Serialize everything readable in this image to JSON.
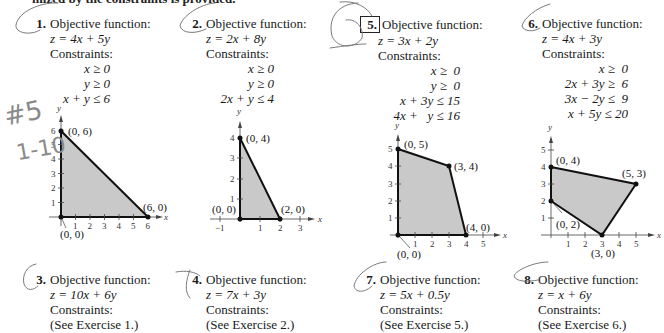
{
  "page": {
    "top_line": "mized by the constraints is provided."
  },
  "exercises": [
    {
      "number": "1.",
      "boxed": false,
      "heading": "Objective function:",
      "objective": "z = 4x + 5y",
      "constraints_label": "Constraints:",
      "constraints": [
        "x ≥ 0",
        "y ≥ 0",
        "x + y ≤ 6"
      ]
    },
    {
      "number": "2.",
      "boxed": false,
      "heading": "Objective function:",
      "objective": "z = 2x + 8y",
      "constraints_label": "Constraints:",
      "constraints": [
        "x ≥ 0",
        "y ≥ 0",
        "2x + y ≤ 4"
      ]
    },
    {
      "number": "3.",
      "boxed": false,
      "heading": "Objective function:",
      "objective": "z = 10x + 6y",
      "constraints_label": "Constraints:",
      "see": "(See Exercise 1.)"
    },
    {
      "number": "4.",
      "boxed": false,
      "heading": "Objective function:",
      "objective": "z = 7x + 3y",
      "constraints_label": "Constraints:",
      "see": "(See Exercise 2.)"
    },
    {
      "number": "5.",
      "boxed": true,
      "heading": "Objective function:",
      "objective": "z = 3x + 2y",
      "constraints_label": "Constraints:",
      "constraints": [
        "x ≥  0",
        "y ≥  0",
        "x + 3y ≤ 15",
        "4x +   y ≤ 16"
      ]
    },
    {
      "number": "6.",
      "boxed": false,
      "heading": "Objective function:",
      "objective": "z = 4x + 3y",
      "constraints_label": "Constraints:",
      "constraints": [
        "x ≥  0",
        "2x + 3y ≥  6",
        "3x − 2y ≤  9",
        "x + 5y ≤ 20"
      ]
    },
    {
      "number": "7.",
      "boxed": false,
      "heading": "Objective function:",
      "objective": "z = 5x + 0.5y",
      "constraints_label": "Constraints:",
      "see": "(See Exercise 5.)"
    },
    {
      "number": "8.",
      "boxed": false,
      "heading": "Objective function:",
      "objective": "z = x + 6y",
      "constraints_label": "Constraints:",
      "see": "(See Exercise 6.)"
    }
  ],
  "graphs": [
    {
      "exercise": "1",
      "x_label": "x",
      "y_label": "y",
      "x_ticks": [
        "1",
        "2",
        "3",
        "4",
        "5",
        "6"
      ],
      "y_ticks": [
        "1",
        "2",
        "3",
        "4",
        "5",
        "6"
      ],
      "vertices": [
        "(0, 6)",
        "(6, 0)",
        "(0, 0)"
      ]
    },
    {
      "exercise": "2",
      "x_label": "x",
      "y_label": "y",
      "x_ticks": [
        "−1",
        "1",
        "2",
        "3"
      ],
      "y_ticks": [
        "1",
        "2",
        "3",
        "4"
      ],
      "vertices": [
        "(0, 4)",
        "(2, 0)",
        "(0, 0)"
      ]
    },
    {
      "exercise": "5",
      "x_label": "x",
      "y_label": "y",
      "x_ticks": [
        "1",
        "2",
        "3",
        "4",
        "5"
      ],
      "y_ticks": [
        "1",
        "2",
        "3",
        "4",
        "5"
      ],
      "vertices": [
        "(0, 5)",
        "(3, 4)",
        "(4, 0)",
        "(0, 0)"
      ]
    },
    {
      "exercise": "6",
      "x_label": "x",
      "y_label": "y",
      "x_ticks": [
        "1",
        "2",
        "3",
        "4",
        "5"
      ],
      "y_ticks": [
        "1",
        "2",
        "3",
        "4",
        "5"
      ],
      "vertices": [
        "(0, 4)",
        "(5, 3)",
        "(0, 2)",
        "(3, 0)"
      ]
    }
  ],
  "handwriting": {
    "margin_note_1": "#5",
    "margin_note_2": "1-10"
  },
  "colors": {
    "region_fill": "#c9c9c9",
    "boundary": "#111111",
    "pencil": "#777777"
  }
}
